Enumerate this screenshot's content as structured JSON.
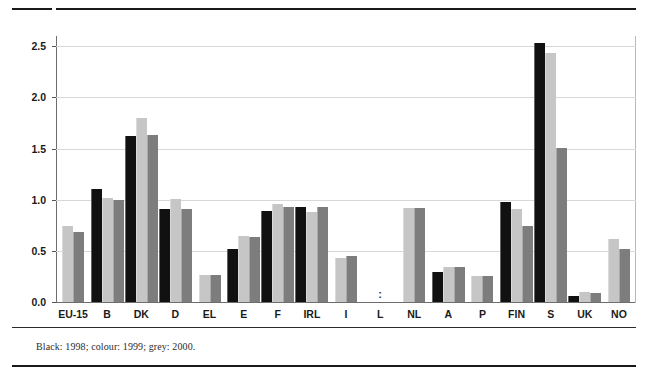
{
  "footnote": "Black: 1998; colour: 1999; grey: 2000.",
  "axis": {
    "y_ticks": [
      "0.0",
      "0.5",
      "1.0",
      "1.5",
      "2.0",
      "2.5"
    ]
  },
  "chart_data": {
    "type": "bar",
    "title": "",
    "subtitle": "",
    "xlabel": "",
    "ylabel": "",
    "ylim": [
      0.0,
      2.6
    ],
    "yticks": [
      0.0,
      0.5,
      1.0,
      1.5,
      2.0,
      2.5
    ],
    "grid": true,
    "legend_position": "footnote",
    "note": "Black: 1998; colour: 1999; grey: 2000.",
    "categories": [
      "EU-15",
      "B",
      "DK",
      "D",
      "EL",
      "E",
      "F",
      "IRL",
      "I",
      "L",
      "NL",
      "A",
      "P",
      "FIN",
      "S",
      "UK",
      "NO"
    ],
    "series": [
      {
        "name": "1998",
        "color": "#111111",
        "values": [
          null,
          1.1,
          1.62,
          0.91,
          null,
          0.52,
          0.89,
          0.93,
          null,
          null,
          null,
          0.29,
          null,
          0.98,
          2.53,
          0.06,
          null
        ]
      },
      {
        "name": "1999",
        "color": "#c6c6c6",
        "values": [
          0.74,
          1.02,
          1.8,
          1.01,
          0.26,
          0.65,
          0.96,
          0.88,
          0.43,
          null,
          0.92,
          0.34,
          0.25,
          0.91,
          2.43,
          0.1,
          0.62
        ]
      },
      {
        "name": "2000",
        "color": "#7d7d7d",
        "values": [
          0.68,
          1.0,
          1.63,
          0.91,
          0.26,
          0.64,
          0.93,
          0.93,
          0.45,
          null,
          0.92,
          0.34,
          0.25,
          0.74,
          1.51,
          0.09,
          0.52
        ]
      }
    ],
    "no_data_marker": ":",
    "no_data_categories": [
      "L"
    ]
  }
}
